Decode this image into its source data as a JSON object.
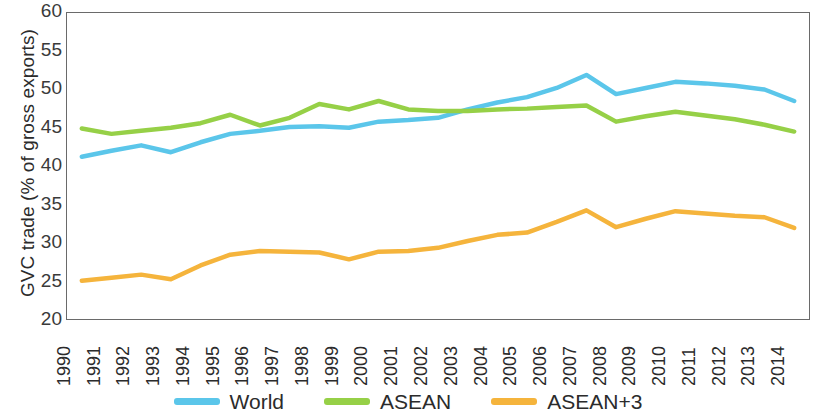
{
  "chart_data": {
    "type": "line",
    "title": "",
    "xlabel": "",
    "ylabel": "GVC trade (% of gross exports)",
    "ylim": [
      20,
      60
    ],
    "yticks": [
      60,
      55,
      50,
      45,
      40,
      35,
      30,
      25,
      20
    ],
    "grid": false,
    "legend_position": "bottom",
    "categories": [
      "1990",
      "1991",
      "1992",
      "1993",
      "1994",
      "1995",
      "1996",
      "1997",
      "1998",
      "1999",
      "2000",
      "2001",
      "2002",
      "2003",
      "2004",
      "2005",
      "2006",
      "2007",
      "2008",
      "2009",
      "2010",
      "2011",
      "2012",
      "2013",
      "2014"
    ],
    "series": [
      {
        "name": "World",
        "color": "#5bc6ea",
        "values": [
          41.2,
          42.0,
          42.7,
          41.8,
          43.1,
          44.2,
          44.6,
          45.1,
          45.2,
          45.0,
          45.8,
          46.0,
          46.3,
          47.4,
          48.3,
          49.0,
          50.2,
          51.9,
          49.4,
          50.2,
          51.0,
          50.8,
          50.5,
          50.0,
          48.5
        ]
      },
      {
        "name": "ASEAN",
        "color": "#96d047",
        "values": [
          44.9,
          44.2,
          44.6,
          45.0,
          45.6,
          46.7,
          45.3,
          46.3,
          48.1,
          47.4,
          48.5,
          47.4,
          47.2,
          47.2,
          47.4,
          47.5,
          47.7,
          47.9,
          45.8,
          46.5,
          47.1,
          46.6,
          46.1,
          45.4,
          44.5
        ]
      },
      {
        "name": "ASEAN+3",
        "color": "#f5b43c",
        "values": [
          25.0,
          25.4,
          25.8,
          25.2,
          27.0,
          28.4,
          28.9,
          28.8,
          28.7,
          27.8,
          28.8,
          28.9,
          29.3,
          30.2,
          31.0,
          31.3,
          32.7,
          34.2,
          32.0,
          33.1,
          34.1,
          33.8,
          33.5,
          33.3,
          31.9
        ]
      }
    ]
  },
  "axis": {
    "y_label": "GVC trade (% of gross exports)"
  },
  "legend": {
    "items": [
      {
        "label": "World",
        "color": "#5bc6ea"
      },
      {
        "label": "ASEAN",
        "color": "#96d047"
      },
      {
        "label": "ASEAN+3",
        "color": "#f5b43c"
      }
    ]
  }
}
